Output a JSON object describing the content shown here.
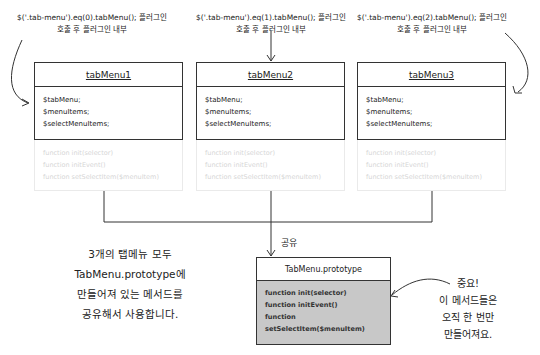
{
  "captions": [
    {
      "line1": "$('.tab-menu').eq(0).tabMenu(); 플러그인",
      "line2": "호출 후 플러그인 내부"
    },
    {
      "line1": "$('.tab-menu').eq(1).tabMenu(); 플러그인",
      "line2": "호출 후 플러그인 내부"
    },
    {
      "line1": "$('.tab-menu').eq(2).tabMenu(); 플러그인",
      "line2": "호출 후 플러그인 내부"
    }
  ],
  "instances": [
    {
      "title": "tabMenu1",
      "properties": [
        "$tabMenu;",
        "$menuItems;",
        "$selectMenuItems;"
      ],
      "methods": [
        "function init(selector)",
        "function initEvent()",
        "function setSelectItem($menuItem)"
      ]
    },
    {
      "title": "tabMenu2",
      "properties": [
        "$tabMenu;",
        "$menuItems;",
        "$selectMenuItems;"
      ],
      "methods": [
        "function init(selector)",
        "function initEvent()",
        "function setSelectItem($menuItem)"
      ]
    },
    {
      "title": "tabMenu3",
      "properties": [
        "$tabMenu;",
        "$menuItems;",
        "$selectMenuItems;"
      ],
      "methods": [
        "function init(selector)",
        "function initEvent()",
        "function setSelectItem($menuItem)"
      ]
    }
  ],
  "share_label": "공유",
  "prototype": {
    "title": "TabMenu.prototype",
    "methods": [
      "function init(selector)",
      "function initEvent()",
      "function setSelectItem($menuItem)"
    ]
  },
  "left_note": [
    "3개의 탭메뉴 모두",
    "TabMenu.prototype에",
    "만들어져 있는 메서드를",
    "공유해서 사용합니다."
  ],
  "right_note": [
    "중요!",
    "이 메서드들은",
    "오직 한 번만",
    "만들어져요."
  ],
  "colors": {
    "line": "#333333",
    "prototype_body": "#c8c8c8",
    "faded_text": "#d6d6d6"
  }
}
